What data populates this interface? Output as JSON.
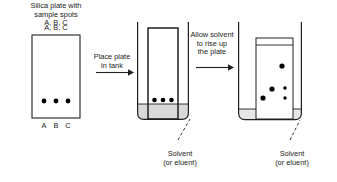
{
  "diagram": {
    "stroke_color": "#231f20",
    "solvent_fill": "#d9d9d9",
    "spot_color": "#000000",
    "background": "#ffffff"
  },
  "labels": {
    "plate_heading": "Silica plate with\nsample spots\nA, B, C",
    "plate_top_letters": "A, B, C",
    "plate_bottom_letters": [
      "A",
      "B",
      "C"
    ],
    "step1": "Place plate\nin tank",
    "step2": "Allow solvent\nto rise up\nthe plate",
    "solvent_label_middle": "Solvent\n(or eluent)",
    "solvent_label_right": "Solvent\n(or eluent)"
  },
  "stage1": {
    "name": "silica-plate",
    "plate": {
      "x": 32,
      "y": 35,
      "w": 48,
      "h": 83
    },
    "spots": [
      {
        "cx": 44,
        "cy": 101,
        "r": 2.4
      },
      {
        "cx": 56,
        "cy": 101,
        "r": 2.4
      },
      {
        "cx": 68,
        "cy": 101,
        "r": 2.4
      }
    ],
    "letters_y": 128,
    "letter_xs": [
      44,
      56,
      68
    ]
  },
  "stage2": {
    "name": "tank-with-plate-inserted",
    "tank": {
      "x": 137,
      "y": 22,
      "w": 52,
      "h": 98
    },
    "solvent_level_y": 105,
    "plate": {
      "x": 148,
      "y": 28,
      "w": 30,
      "h": 92
    },
    "spots": [
      {
        "cx": 154,
        "cy": 100,
        "r": 2.3
      },
      {
        "cx": 163,
        "cy": 100,
        "r": 2.3
      },
      {
        "cx": 172,
        "cy": 100,
        "r": 2.3
      }
    ]
  },
  "stage3": {
    "name": "tank-after-separation",
    "tank": {
      "x": 238,
      "y": 22,
      "w": 64,
      "h": 98
    },
    "solvent_level_y": 110,
    "plate": {
      "x": 256,
      "y": 38,
      "w": 36,
      "h": 82
    },
    "plate_baseline_y": 45,
    "spots": [
      {
        "cx": 282,
        "cy": 66,
        "r": 2.6
      },
      {
        "cx": 272,
        "cy": 89,
        "r": 2.6
      },
      {
        "cx": 285,
        "cy": 89,
        "r": 1.7
      },
      {
        "cx": 263,
        "cy": 98,
        "r": 2.6
      },
      {
        "cx": 285,
        "cy": 98,
        "r": 1.7
      }
    ]
  },
  "arrows": [
    {
      "name": "arrow-step1",
      "x1": 96,
      "y1": 72,
      "x2": 130,
      "y2": 72
    },
    {
      "name": "arrow-step2",
      "x1": 196,
      "y1": 67,
      "x2": 232,
      "y2": 67
    }
  ],
  "pointers": [
    {
      "name": "pointer-solvent-middle",
      "x1": 177,
      "y1": 141,
      "x2": 190,
      "y2": 118
    },
    {
      "name": "pointer-solvent-right",
      "x1": 289,
      "y1": 141,
      "x2": 300,
      "y2": 119
    }
  ]
}
